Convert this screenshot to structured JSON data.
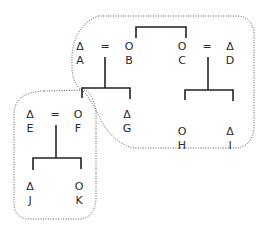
{
  "diagram": {
    "type": "kinship-diagram",
    "symbols": {
      "male": "Δ",
      "female": "O",
      "marriage": "="
    },
    "individuals": [
      {
        "id": "A",
        "symbol": "Δ",
        "x": 80,
        "y": 41
      },
      {
        "id": "B",
        "symbol": "O",
        "x": 129,
        "y": 41
      },
      {
        "id": "C",
        "symbol": "O",
        "x": 182,
        "y": 41
      },
      {
        "id": "D",
        "symbol": "Δ",
        "x": 230,
        "y": 41
      },
      {
        "id": "E",
        "symbol": "Δ",
        "x": 30,
        "y": 109
      },
      {
        "id": "F",
        "symbol": "O",
        "x": 78,
        "y": 109
      },
      {
        "id": "G",
        "symbol": "Δ",
        "x": 127,
        "y": 109
      },
      {
        "id": "H",
        "symbol": "O",
        "x": 182,
        "y": 126
      },
      {
        "id": "I",
        "symbol": "Δ",
        "x": 230,
        "y": 126
      },
      {
        "id": "J",
        "symbol": "Δ",
        "x": 30,
        "y": 181
      },
      {
        "id": "K",
        "symbol": "O",
        "x": 79,
        "y": 181
      }
    ],
    "marriages": [
      {
        "a": "A",
        "b": "B",
        "x": 105,
        "y": 48
      },
      {
        "a": "C",
        "b": "D",
        "x": 207,
        "y": 48
      },
      {
        "a": "E",
        "b": "F",
        "x": 55,
        "y": 116
      }
    ],
    "sibling_groups": [
      {
        "children": [
          "B",
          "C"
        ]
      },
      {
        "parents": [
          "A",
          "B"
        ],
        "children": [
          "F",
          "G"
        ]
      },
      {
        "parents": [
          "C",
          "D"
        ],
        "children": [
          "H",
          "I"
        ]
      },
      {
        "parents": [
          "E",
          "F"
        ],
        "children": [
          "J",
          "K"
        ]
      }
    ],
    "groupings": [
      {
        "name": "upper-group",
        "members": [
          "A",
          "B",
          "C",
          "D",
          "G",
          "H",
          "I"
        ]
      },
      {
        "name": "lower-group",
        "members": [
          "E",
          "F",
          "J",
          "K"
        ]
      }
    ]
  }
}
